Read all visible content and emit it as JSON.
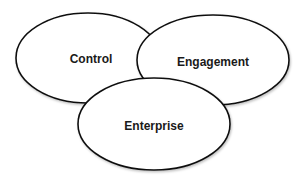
{
  "diagram": {
    "type": "overlapping-ellipses",
    "nodes": [
      {
        "id": "control",
        "label": "Control"
      },
      {
        "id": "engagement",
        "label": "Engagement"
      },
      {
        "id": "enterprise",
        "label": "Enterprise"
      }
    ],
    "colors": {
      "stroke": "#111111",
      "fill": "#ffffff",
      "text": "#1a1a1a"
    }
  }
}
